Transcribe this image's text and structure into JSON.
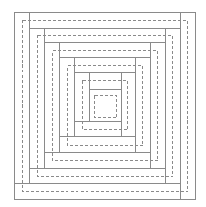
{
  "diagram": {
    "title": "",
    "stroke_color": "#8a8a8a",
    "background": "#ffffff",
    "outer_frame": {
      "x1": 14,
      "y1": 12,
      "x2": 195,
      "y2": 199
    },
    "solid_lines": [
      {
        "x1": 29,
        "y1": 12,
        "x2": 29,
        "y2": 183
      },
      {
        "x1": 14,
        "y1": 183,
        "x2": 180,
        "y2": 183
      },
      {
        "x1": 180,
        "y1": 12,
        "x2": 180,
        "y2": 199
      },
      {
        "x1": 29,
        "y1": 28,
        "x2": 180,
        "y2": 28
      },
      {
        "x1": 44,
        "y1": 28,
        "x2": 44,
        "y2": 168
      },
      {
        "x1": 29,
        "y1": 168,
        "x2": 165,
        "y2": 168
      },
      {
        "x1": 165,
        "y1": 28,
        "x2": 165,
        "y2": 183
      },
      {
        "x1": 44,
        "y1": 42,
        "x2": 165,
        "y2": 42
      },
      {
        "x1": 59,
        "y1": 42,
        "x2": 59,
        "y2": 152
      },
      {
        "x1": 44,
        "y1": 152,
        "x2": 150,
        "y2": 152
      },
      {
        "x1": 150,
        "y1": 42,
        "x2": 150,
        "y2": 168
      },
      {
        "x1": 59,
        "y1": 57,
        "x2": 150,
        "y2": 57
      },
      {
        "x1": 74,
        "y1": 57,
        "x2": 74,
        "y2": 136
      },
      {
        "x1": 59,
        "y1": 136,
        "x2": 135,
        "y2": 136
      },
      {
        "x1": 135,
        "y1": 57,
        "x2": 135,
        "y2": 152
      },
      {
        "x1": 74,
        "y1": 72,
        "x2": 135,
        "y2": 72
      },
      {
        "x1": 89,
        "y1": 72,
        "x2": 89,
        "y2": 121
      },
      {
        "x1": 74,
        "y1": 121,
        "x2": 121,
        "y2": 121
      },
      {
        "x1": 121,
        "y1": 72,
        "x2": 121,
        "y2": 136
      },
      {
        "x1": 89,
        "y1": 89,
        "x2": 121,
        "y2": 89
      }
    ],
    "dashed_rects": [
      {
        "x": 22,
        "y": 20,
        "w": 165,
        "h": 171
      },
      {
        "x": 37,
        "y": 35,
        "w": 135,
        "h": 141
      },
      {
        "x": 52,
        "y": 50,
        "w": 105,
        "h": 110
      },
      {
        "x": 67,
        "y": 65,
        "w": 75,
        "h": 80
      },
      {
        "x": 82,
        "y": 80,
        "w": 45,
        "h": 49
      },
      {
        "x": 94,
        "y": 95,
        "w": 22,
        "h": 22
      }
    ]
  }
}
